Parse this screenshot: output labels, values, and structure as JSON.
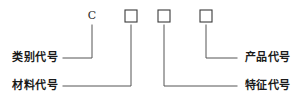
{
  "diagram": {
    "type": "designation-code-breakdown",
    "width": 300,
    "height": 100,
    "background_color": "#ffffff",
    "line_color": "#555555",
    "text_color": "#1a1a1a",
    "box_stroke_color": "#3a3a3a"
  },
  "code_slots": [
    {
      "id": "slot-category",
      "kind": "letter",
      "value": "C",
      "x": 92,
      "y": 16
    },
    {
      "id": "slot-material",
      "kind": "box",
      "value": "",
      "x": 131,
      "y": 16
    },
    {
      "id": "slot-feature",
      "kind": "box",
      "value": "",
      "x": 164,
      "y": 16
    },
    {
      "id": "slot-product",
      "kind": "box",
      "value": "",
      "x": 206,
      "y": 16
    }
  ],
  "callouts": [
    {
      "id": "callout-category",
      "label": "类别代号",
      "side": "left",
      "label_x": 13,
      "label_y": 52,
      "leader": "M 63 58 L 92 58 L 92 25"
    },
    {
      "id": "callout-material",
      "label": "材料代号",
      "side": "left",
      "label_x": 13,
      "label_y": 80,
      "leader": "M 63 86 L 131 86 L 131 25"
    },
    {
      "id": "callout-product",
      "label": "产品代号",
      "side": "right",
      "label_x": 245,
      "label_y": 52,
      "leader": "M 237 58 L 206 58 L 206 25"
    },
    {
      "id": "callout-feature",
      "label": "特征代号",
      "side": "right",
      "label_x": 245,
      "label_y": 80,
      "leader": "M 237 86 L 164 86 L 164 25"
    }
  ]
}
